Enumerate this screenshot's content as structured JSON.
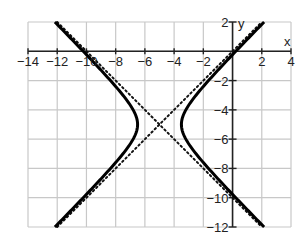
{
  "chart_data": {
    "type": "line",
    "title": "",
    "xlabel": "x",
    "ylabel": "y",
    "xlim": [
      -14,
      4
    ],
    "ylim": [
      -12,
      2
    ],
    "grid": true,
    "grid_step": 2,
    "x_ticks": [
      -14,
      -12,
      -10,
      -8,
      -6,
      -4,
      -2,
      2,
      4
    ],
    "x_tick_labels": [
      "−14",
      "−12",
      "−10",
      "−8",
      "−6",
      "−4",
      "−2",
      "2",
      "4"
    ],
    "y_ticks": [
      2,
      -2,
      -4,
      -6,
      -8,
      -10,
      -12
    ],
    "y_tick_labels": [
      "2",
      "−2",
      "−4",
      "−6",
      "−8",
      "−10",
      "−12"
    ],
    "series": [
      {
        "name": "hyperbola",
        "equation": "(x+5)^2/2.25 - (y+5)^2/2.25 = 1",
        "center": [
          -5,
          -5
        ],
        "vertices": [
          [
            -6.5,
            -5
          ],
          [
            -3.5,
            -5
          ]
        ],
        "a": 1.5,
        "b": 1.5,
        "style": "solid"
      },
      {
        "name": "asymptote-1",
        "equation": "y = x",
        "points": [
          [
            -12,
            -12
          ],
          [
            2,
            2
          ]
        ],
        "style": "dotted"
      },
      {
        "name": "asymptote-2",
        "equation": "y = -x - 10",
        "points": [
          [
            -12,
            2
          ],
          [
            2,
            -12
          ]
        ],
        "style": "dotted"
      }
    ]
  },
  "axes": {
    "x_label": "x",
    "y_label": "y"
  }
}
